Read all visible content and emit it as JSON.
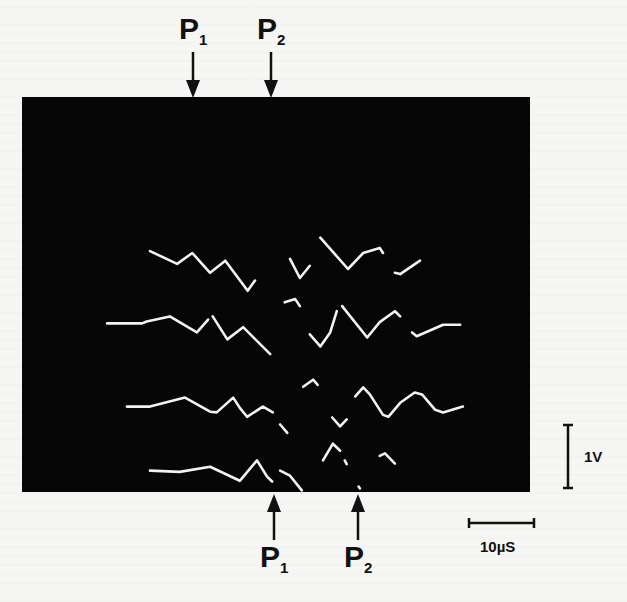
{
  "figure": {
    "type": "oscillogram",
    "screen_color": "#060606",
    "trace_color": "#f2f2f2",
    "paper_color": "#f6f6f4"
  },
  "markers": {
    "top": [
      {
        "label": "P",
        "subscript": "1",
        "time_us": 25.9
      },
      {
        "label": "P",
        "subscript": "2",
        "time_us": 37.7
      }
    ],
    "bottom": [
      {
        "label": "P",
        "subscript": "1",
        "time_us": 38.2
      },
      {
        "label": "P",
        "subscript": "2",
        "time_us": 50.9
      }
    ]
  },
  "scale_bars": {
    "vertical": {
      "label": "1V",
      "value": 1,
      "unit": "V"
    },
    "horizontal": {
      "label": "10µS",
      "value": 10,
      "unit": "µS"
    }
  },
  "chart_data": {
    "type": "line",
    "title": "",
    "xlabel": "time (µS)",
    "ylabel": "voltage (V, relative to each trace baseline)",
    "xlim": [
      0,
      77
    ],
    "trace_offsets_V": [
      3.3,
      2.4,
      1.1,
      0.1
    ],
    "series": [
      {
        "name": "trace-1",
        "segments": [
          [
            [
              19.4,
              0.23
            ],
            [
              23.5,
              0.03
            ],
            [
              25.8,
              0.2
            ],
            [
              28.5,
              -0.11
            ],
            [
              30.8,
              0.08
            ],
            [
              34.2,
              -0.39
            ],
            [
              35.3,
              -0.23
            ]
          ],
          [
            [
              40.6,
              0.11
            ],
            [
              42.1,
              -0.19
            ],
            [
              43.6,
              0
            ]
          ],
          [
            [
              45.2,
              0.44
            ],
            [
              49.4,
              -0.05
            ],
            [
              51.7,
              0.2
            ],
            [
              54.2,
              0.28
            ],
            [
              54.7,
              0.2
            ]
          ],
          [
            [
              56.5,
              -0.11
            ],
            [
              57.3,
              -0.13
            ],
            [
              60.3,
              0.08
            ]
          ]
        ]
      },
      {
        "name": "trace-2",
        "segments": [
          [
            [
              12.9,
              0
            ],
            [
              18.2,
              0
            ],
            [
              18.9,
              0.03
            ],
            [
              22.4,
              0.11
            ],
            [
              26.5,
              -0.14
            ],
            [
              28.2,
              0.06
            ]
          ],
          [
            [
              28.9,
              0.11
            ],
            [
              31.1,
              -0.25
            ],
            [
              33.5,
              -0.06
            ],
            [
              37.6,
              -0.48
            ]
          ],
          [
            [
              39.8,
              0.33
            ],
            [
              41.4,
              0.38
            ],
            [
              42.1,
              0.27
            ]
          ],
          [
            [
              43.6,
              -0.17
            ],
            [
              45.2,
              -0.36
            ],
            [
              46.7,
              -0.14
            ],
            [
              47.7,
              0.19
            ]
          ],
          [
            [
              48.5,
              0.27
            ],
            [
              52.3,
              -0.22
            ],
            [
              54.2,
              0.02
            ],
            [
              56.5,
              0.19
            ],
            [
              57.3,
              0.11
            ]
          ],
          [
            [
              59.1,
              -0.14
            ],
            [
              59.8,
              -0.2
            ],
            [
              63.8,
              -0.02
            ],
            [
              66.4,
              -0.02
            ]
          ]
        ]
      },
      {
        "name": "trace-3",
        "segments": [
          [
            [
              15.9,
              0
            ],
            [
              19.4,
              0
            ],
            [
              24.7,
              0.14
            ],
            [
              28.5,
              -0.08
            ],
            [
              29.5,
              -0.09
            ],
            [
              32,
              0.14
            ],
            [
              33,
              -0.02
            ],
            [
              34.1,
              -0.16
            ],
            [
              36.5,
              0
            ],
            [
              38,
              -0.09
            ]
          ],
          [
            [
              39.1,
              -0.28
            ],
            [
              40.2,
              -0.41
            ]
          ],
          [
            [
              42.6,
              0.31
            ],
            [
              44.1,
              0.42
            ],
            [
              44.8,
              0.34
            ]
          ],
          [
            [
              47,
              -0.17
            ],
            [
              48.2,
              -0.31
            ],
            [
              49.2,
              -0.2
            ]
          ],
          [
            [
              50.5,
              0.16
            ],
            [
              51.7,
              0.3
            ],
            [
              52.7,
              0.19
            ],
            [
              54.7,
              -0.13
            ],
            [
              55.5,
              -0.16
            ],
            [
              57.3,
              0.06
            ],
            [
              59.5,
              0.22
            ],
            [
              60.6,
              0.19
            ],
            [
              62.6,
              -0.05
            ],
            [
              63.8,
              -0.09
            ],
            [
              66.8,
              0
            ]
          ]
        ]
      },
      {
        "name": "trace-4",
        "segments": [
          [
            [
              19.4,
              0
            ],
            [
              23.9,
              -0.02
            ],
            [
              28.5,
              0.06
            ],
            [
              33,
              -0.16
            ],
            [
              35.6,
              0.16
            ],
            [
              37.1,
              -0.09
            ],
            [
              37.9,
              -0.17
            ]
          ],
          [
            [
              39.1,
              0
            ],
            [
              40.6,
              -0.08
            ],
            [
              42.4,
              -0.31
            ]
          ],
          [
            [
              45.6,
              0.16
            ],
            [
              47.1,
              0.42
            ],
            [
              48.2,
              0.31
            ]
          ],
          [
            [
              48.9,
              0.16
            ],
            [
              49.2,
              0.1
            ]
          ],
          [
            [
              51.0,
              -0.25
            ],
            [
              51.2,
              -0.28
            ]
          ],
          [
            [
              54.2,
              0.23
            ],
            [
              55,
              0.27
            ],
            [
              56.5,
              0.11
            ]
          ]
        ]
      }
    ]
  }
}
